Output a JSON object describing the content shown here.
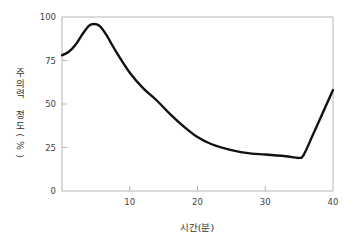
{
  "chart_data": {
    "type": "line",
    "title": "",
    "xlabel": "시간(분)",
    "ylabel": "주의력 정도(%)",
    "xlim": [
      0,
      40
    ],
    "ylim": [
      0,
      100
    ],
    "xticks": [
      10,
      20,
      30,
      40
    ],
    "yticks": [
      0,
      25,
      50,
      75,
      100
    ],
    "grid": false,
    "legend": null,
    "series": [
      {
        "name": "주의력 정도",
        "color": "#111111",
        "x": [
          0,
          1,
          2,
          3,
          4,
          4.7,
          5.5,
          6.5,
          8,
          10,
          12,
          14,
          16,
          18,
          20,
          22,
          25,
          28,
          30,
          33,
          35,
          35.7,
          37,
          38.5,
          40
        ],
        "y": [
          78,
          80,
          84,
          90,
          95,
          96,
          95,
          90,
          80,
          68,
          59,
          52,
          44,
          37,
          31,
          27,
          23.5,
          21.5,
          21,
          20,
          19,
          21,
          32,
          45,
          58
        ]
      }
    ]
  }
}
